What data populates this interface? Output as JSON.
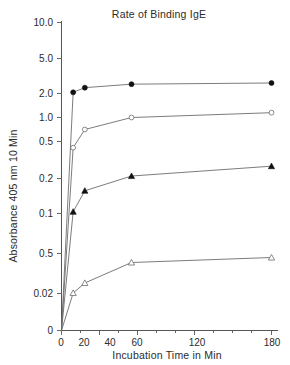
{
  "chart_data": {
    "type": "line",
    "title": "Rate of Binding IgE",
    "xlabel": "Incubation Time in Min",
    "ylabel": "Absorbance 405 nm 10 Min",
    "grid": false,
    "legend_position": "none",
    "x": [
      0,
      10,
      20,
      60,
      180
    ],
    "xlim": [
      0,
      180
    ],
    "x_ticks": [
      0,
      20,
      40,
      60,
      120,
      180
    ],
    "x_tick_labels": [
      "0",
      "20",
      "40",
      "60",
      "120",
      "180"
    ],
    "y_scale": "custom-nonlinear",
    "y_ticks": [
      10.0,
      5.0,
      2.0,
      1.0,
      0.5,
      0.2,
      0.1,
      0.5,
      0.02,
      0
    ],
    "y_tick_labels": [
      "10.0",
      "5.0",
      "2.0",
      "1.0",
      "0.5",
      "0.2",
      "0.1",
      "0.5",
      "0.02",
      "0"
    ],
    "series": [
      {
        "name": "series-1",
        "marker": "filled-circle",
        "values": [
          0,
          2.1,
          2.5,
          2.8,
          2.9
        ]
      },
      {
        "name": "series-2",
        "marker": "open-circle",
        "values": [
          0,
          0.45,
          0.75,
          1.0,
          1.2
        ]
      },
      {
        "name": "series-3",
        "marker": "filled-triangle",
        "values": [
          0,
          0.105,
          0.165,
          0.22,
          0.3
        ]
      },
      {
        "name": "series-4",
        "marker": "open-triangle",
        "values": [
          0,
          0.25,
          0.32,
          0.45,
          0.5
        ]
      }
    ]
  },
  "axes": {
    "y_tick_labels": [
      "10.0",
      "5.0",
      "2.0",
      "1.0",
      "0.5",
      "0.2",
      "0.1",
      "0.5",
      "0.02",
      "0"
    ],
    "x_tick_labels": [
      "0",
      "20",
      "40",
      "60",
      "120",
      "180"
    ]
  },
  "colors": {
    "axis": "#555555",
    "line": "#6d6d6d",
    "marker_fill": "#111111",
    "marker_open_fill": "#ffffff",
    "text": "#2b2b2b",
    "background": "#ffffff"
  }
}
